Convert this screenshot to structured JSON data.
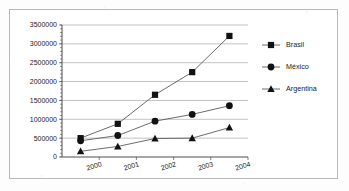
{
  "chart_data": {
    "type": "line",
    "title": "",
    "subtitle": "",
    "xlabel": "",
    "ylabel": "",
    "xlim": [
      1999,
      2004
    ],
    "ylim": [
      0,
      3500000
    ],
    "grid": true,
    "legend_position": "right",
    "x": [
      1999.5,
      2000.5,
      2001.5,
      2002.5,
      2003.5
    ],
    "x_tick_labels": [
      "2000",
      "2001",
      "2002",
      "2003",
      "2004"
    ],
    "x_tick_values": [
      2000,
      2001,
      2002,
      2003,
      2004
    ],
    "y_tick_labels": [
      "0",
      "500000",
      "1000000",
      "1500000",
      "2000000",
      "2500000",
      "3000000",
      "3500000"
    ],
    "y_tick_values": [
      0,
      500000,
      1000000,
      1500000,
      2000000,
      2500000,
      3000000,
      3500000
    ],
    "series": [
      {
        "name": "Brasil",
        "marker": "square",
        "values": [
          500000,
          880000,
          1650000,
          2250000,
          3210000
        ]
      },
      {
        "name": "México",
        "marker": "circle",
        "values": [
          430000,
          570000,
          950000,
          1130000,
          1360000
        ]
      },
      {
        "name": "Argentina",
        "marker": "triangle",
        "values": [
          150000,
          280000,
          490000,
          500000,
          780000
        ]
      }
    ]
  },
  "legend": {
    "items": [
      {
        "label": "Brasil",
        "marker": "square"
      },
      {
        "label": "México",
        "marker": "circle"
      },
      {
        "label": "Argentina",
        "marker": "triangle"
      }
    ]
  },
  "colors": {
    "marker": "#111111",
    "line": "#5a5a5a",
    "grid": "#a6a6a6",
    "axis": "#4d4d4d",
    "text": "#1a1a1a",
    "background": "#ffffff",
    "frame": "#b9b9b9"
  }
}
